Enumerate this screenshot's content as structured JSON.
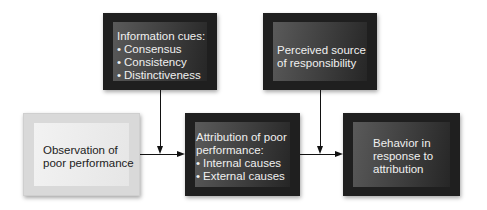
{
  "diagram": {
    "nodes": [
      {
        "id": "information-cues",
        "title": "Information cues:",
        "bullets": [
          "Consensus",
          "Consistency",
          "Distinctiveness"
        ],
        "style": "dark"
      },
      {
        "id": "perceived-source",
        "lines": [
          "Perceived source",
          "of responsibility"
        ],
        "style": "dark"
      },
      {
        "id": "observation",
        "lines": [
          "Observation of",
          "poor performance"
        ],
        "style": "light"
      },
      {
        "id": "attribution",
        "lines": [
          "Attribution of poor",
          "performance:"
        ],
        "bullets": [
          "Internal causes",
          "External causes"
        ],
        "style": "dark"
      },
      {
        "id": "behavior",
        "lines": [
          "Behavior in",
          "response to",
          "attribution"
        ],
        "style": "dark"
      }
    ],
    "edges": [
      {
        "from": "observation",
        "to": "attribution"
      },
      {
        "from": "information-cues",
        "to": "attribution"
      },
      {
        "from": "attribution",
        "to": "behavior"
      },
      {
        "from": "perceived-source",
        "to": "behavior"
      }
    ]
  }
}
